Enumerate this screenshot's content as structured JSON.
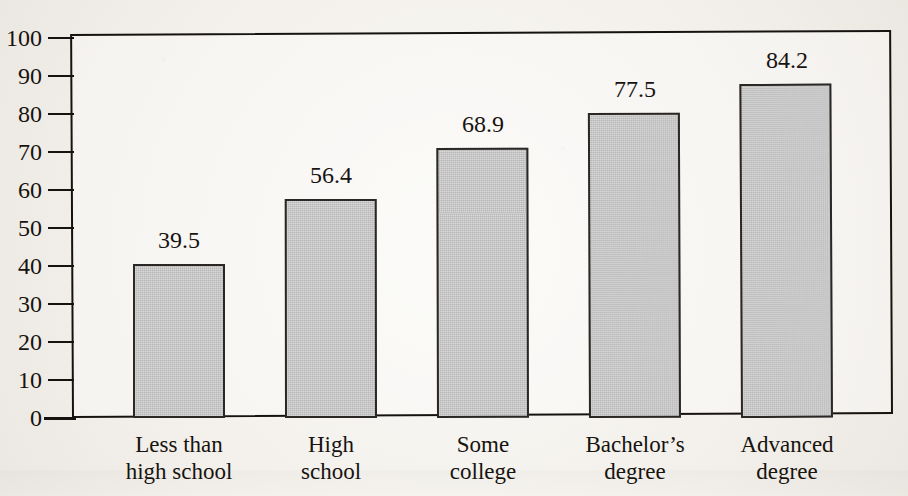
{
  "chart_data": {
    "type": "bar",
    "title": "",
    "xlabel": "",
    "ylabel": "",
    "ylim": [
      0,
      100
    ],
    "ytick_step": 10,
    "grid": false,
    "legend": null,
    "categories": [
      "Less than high school",
      "High school",
      "Some college",
      "Bachelor's degree",
      "Advanced degree"
    ],
    "category_lines": [
      [
        "Less than",
        "high school"
      ],
      [
        "High",
        "school"
      ],
      [
        "Some",
        "college"
      ],
      [
        "Bachelor’s",
        "degree"
      ],
      [
        "Advanced",
        "degree"
      ]
    ],
    "values": [
      39.5,
      56.4,
      68.9,
      77.5,
      84.2
    ],
    "value_labels": [
      "39.5",
      "56.4",
      "68.9",
      "77.5",
      "84.2"
    ],
    "drawn_heights": [
      40.5,
      57.6,
      71.0,
      80.3,
      88.0
    ],
    "ytick_labels": [
      "100",
      "90",
      "80",
      "70",
      "60",
      "50",
      "40",
      "30",
      "20",
      "10",
      "0"
    ],
    "ytick_values": [
      100,
      90,
      80,
      70,
      60,
      50,
      40,
      30,
      20,
      10,
      0
    ],
    "colors": {
      "bar_fill": "#c3c3c3",
      "bar_stroke": "#2b2724",
      "axis": "#15120f",
      "text": "#17130f",
      "page": "#f4f2ee"
    }
  }
}
